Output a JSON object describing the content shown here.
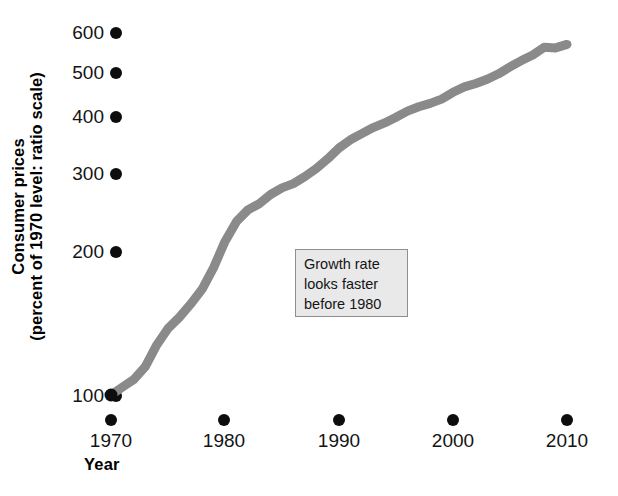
{
  "chart_data": {
    "type": "line",
    "title": "",
    "xlabel": "Year",
    "ylabel_line1": "Consumer prices",
    "ylabel_line2": "(percent of 1970 level: ratio scale)",
    "yscale": "log",
    "ylim": [
      90,
      640
    ],
    "xlim": [
      1969,
      2011
    ],
    "grid": false,
    "legend": null,
    "x_ticks": [
      1970,
      1980,
      1990,
      2000,
      2010
    ],
    "x_tick_labels": [
      "1970",
      "1980",
      "1990",
      "2000",
      "2010"
    ],
    "y_ticks": [
      100,
      200,
      300,
      400,
      500,
      600
    ],
    "y_tick_labels": [
      "100",
      "200",
      "300",
      "400",
      "500",
      "600"
    ],
    "series": [
      {
        "name": "Consumer prices",
        "color": "#8a8a8a",
        "linewidth": 9,
        "x": [
          1970,
          1971,
          1972,
          1973,
          1974,
          1975,
          1976,
          1977,
          1978,
          1979,
          1980,
          1981,
          1982,
          1983,
          1984,
          1985,
          1986,
          1987,
          1988,
          1989,
          1990,
          1991,
          1992,
          1993,
          1994,
          1995,
          1996,
          1997,
          1998,
          1999,
          2000,
          2001,
          2002,
          2003,
          2004,
          2005,
          2006,
          2007,
          2008,
          2009,
          2010
        ],
        "y": [
          100,
          104,
          108,
          115,
          128,
          139,
          147,
          157,
          169,
          188,
          214,
          236,
          250,
          258,
          270,
          279,
          285,
          295,
          307,
          322,
          340,
          354,
          365,
          376,
          385,
          396,
          408,
          417,
          424,
          433,
          448,
          460,
          468,
          478,
          491,
          508,
          524,
          539,
          560,
          558,
          568
        ]
      }
    ],
    "annotations": [
      {
        "id": "growth-rate-note",
        "lines": [
          "Growth rate",
          "looks faster",
          "before 1980"
        ],
        "box_fill": "#e9e9e9",
        "box_stroke": "#8e8e8e"
      }
    ]
  },
  "axes": {
    "y_title_line1": "Consumer prices",
    "y_title_line2": "(percent of 1970 level: ratio scale)",
    "x_title": "Year"
  },
  "colors": {
    "line": "#8a8a8a",
    "tick_dot": "#0d0d0d",
    "text": "#141414",
    "annotation_fill": "#e9e9e9",
    "annotation_border": "#8e8e8e",
    "background": "#ffffff"
  }
}
